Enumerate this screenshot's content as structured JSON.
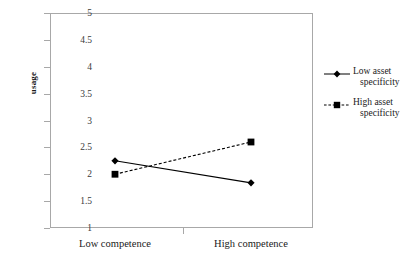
{
  "chart_data": {
    "type": "line",
    "title": "",
    "xlabel": "",
    "ylabel": "usage",
    "categories": [
      "Low competence",
      "High competence"
    ],
    "ylim": [
      1,
      5
    ],
    "yticks": [
      1,
      1.5,
      2,
      2.5,
      3,
      3.5,
      4,
      4.5,
      5
    ],
    "ytick_labels": [
      "1",
      "1.5",
      "2",
      "2.5",
      "3",
      "3.5",
      "4",
      "4.5",
      "5"
    ],
    "grid": false,
    "legend_position": "right",
    "series": [
      {
        "name": "Low asset specificity",
        "name_line1": "Low asset",
        "name_line2": "specificity",
        "values": [
          2.25,
          1.84
        ],
        "linestyle": "solid",
        "marker": "diamond",
        "color": "#000000"
      },
      {
        "name": "High asset specificity",
        "name_line1": "High asset",
        "name_line2": "specificity",
        "values": [
          2.0,
          2.6
        ],
        "linestyle": "dashed",
        "marker": "square",
        "color": "#000000"
      }
    ]
  },
  "axis": {
    "y_label": "usage",
    "y_tick_labels": [
      "5",
      "4.5",
      "4",
      "3.5",
      "3",
      "2.5",
      "2",
      "1.5",
      "1"
    ],
    "x_tick_labels": [
      "Low competence",
      "High competence"
    ]
  },
  "legend": {
    "entries": [
      {
        "line1": "Low asset",
        "line2": "specificity"
      },
      {
        "line1": "High asset",
        "line2": "specificity"
      }
    ]
  },
  "colors": {
    "series": "#000000",
    "frame": "#a8a8a8",
    "text": "#1a1a1a"
  }
}
